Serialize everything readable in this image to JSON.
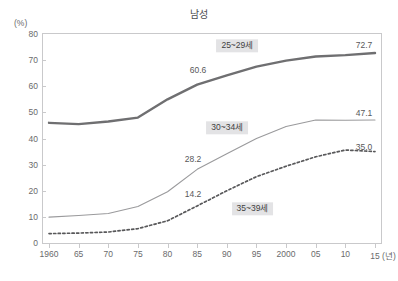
{
  "chart_data": {
    "type": "line",
    "title": "남성",
    "xlabel": "(년)",
    "ylabel": "(%)",
    "ylim": [
      0,
      80
    ],
    "ytick_step": 10,
    "grid": false,
    "legend_position": "inline",
    "x": [
      "1960",
      "65",
      "70",
      "75",
      "80",
      "85",
      "90",
      "95",
      "2000",
      "05",
      "10",
      "15"
    ],
    "yticks": [
      "80",
      "70",
      "60",
      "50",
      "40",
      "30",
      "20",
      "10",
      "0"
    ],
    "xtick_labels": [
      "1960",
      "65",
      "70",
      "75",
      "80",
      "85",
      "90",
      "95",
      "2000",
      "05",
      "10",
      "15"
    ],
    "x_axis_unit": "(년)",
    "series": [
      {
        "name": "25~29세",
        "style": "solid-thick",
        "color": "#6f6f71",
        "values": [
          46.0,
          45.5,
          46.5,
          48.0,
          55.0,
          60.6,
          64.2,
          67.5,
          69.8,
          71.4,
          71.9,
          72.7
        ],
        "annotations": [
          {
            "x": "85",
            "value": "60.6"
          },
          {
            "x": "15",
            "value": "72.7"
          }
        ]
      },
      {
        "name": "30~34세",
        "style": "solid-thin",
        "color": "#9a9a9c",
        "values": [
          9.9,
          10.5,
          11.3,
          14.0,
          19.6,
          28.2,
          34.2,
          40.0,
          44.6,
          47.1,
          47.0,
          47.1
        ],
        "annotations": [
          {
            "x": "85",
            "value": "28.2"
          },
          {
            "x": "15",
            "value": "47.1"
          }
        ]
      },
      {
        "name": "35~39세",
        "style": "dotted",
        "color": "#58585a",
        "values": [
          3.6,
          3.8,
          4.2,
          5.5,
          8.5,
          14.2,
          20.0,
          25.4,
          29.4,
          33.0,
          35.6,
          35.0
        ],
        "annotations": [
          {
            "x": "85",
            "value": "14.2"
          },
          {
            "x": "15",
            "value": "35.0"
          }
        ]
      }
    ],
    "series_tags": [
      {
        "label": "25~29세",
        "x_frac": 0.575,
        "y_value": 75.5
      },
      {
        "label": "30~34세",
        "x_frac": 0.545,
        "y_value": 44.2
      },
      {
        "label": "35~39세",
        "x_frac": 0.62,
        "y_value": 13.0
      }
    ],
    "value_annotations": [
      {
        "text": "72.7",
        "x_px": 364,
        "y_px": 45
      },
      {
        "text": "60.6",
        "x_px": 198,
        "y_px": 70
      },
      {
        "text": "47.1",
        "x_px": 364,
        "y_px": 113
      },
      {
        "text": "35.0",
        "x_px": 364,
        "y_px": 147
      },
      {
        "text": "28.2",
        "x_px": 193,
        "y_px": 159
      },
      {
        "text": "14.2",
        "x_px": 193,
        "y_px": 194
      }
    ],
    "colors": {
      "frame": "#c9c9cb",
      "text": "#58585a",
      "tag_background": "#e3e3e5",
      "series_25_29": "#6f6f71",
      "series_30_34": "#9a9a9c",
      "series_35_39": "#58585a"
    }
  }
}
